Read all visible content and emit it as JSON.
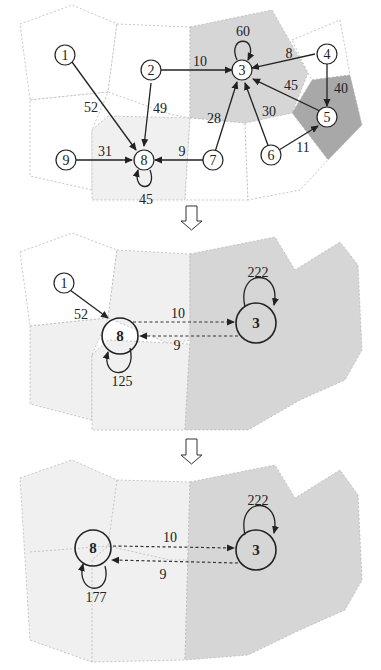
{
  "panels": [
    {
      "id": "initial-graph",
      "nodes": [
        {
          "id": "1",
          "label": "1"
        },
        {
          "id": "2",
          "label": "2"
        },
        {
          "id": "3",
          "label": "3"
        },
        {
          "id": "4",
          "label": "4"
        },
        {
          "id": "5",
          "label": "5"
        },
        {
          "id": "6",
          "label": "6"
        },
        {
          "id": "7",
          "label": "7"
        },
        {
          "id": "8",
          "label": "8"
        },
        {
          "id": "9",
          "label": "9"
        }
      ],
      "edges": [
        {
          "from": "1",
          "to": "8",
          "weight": "52"
        },
        {
          "from": "2",
          "to": "8",
          "weight": "49"
        },
        {
          "from": "2",
          "to": "3",
          "weight": "10"
        },
        {
          "from": "3",
          "to": "3",
          "weight": "60"
        },
        {
          "from": "4",
          "to": "3",
          "weight": "8"
        },
        {
          "from": "4",
          "to": "5",
          "weight": "40"
        },
        {
          "from": "5",
          "to": "3",
          "weight": "45"
        },
        {
          "from": "6",
          "to": "3",
          "weight": "30"
        },
        {
          "from": "6",
          "to": "5",
          "weight": "11"
        },
        {
          "from": "7",
          "to": "3",
          "weight": "28"
        },
        {
          "from": "7",
          "to": "8",
          "weight": "9"
        },
        {
          "from": "9",
          "to": "8",
          "weight": "31"
        },
        {
          "from": "8",
          "to": "8",
          "weight": "45"
        }
      ]
    },
    {
      "id": "intermediate-graph",
      "nodes": [
        {
          "id": "1",
          "label": "1"
        },
        {
          "id": "8",
          "label": "8"
        },
        {
          "id": "3",
          "label": "3"
        }
      ],
      "edges": [
        {
          "from": "1",
          "to": "8",
          "weight": "52"
        },
        {
          "from": "8",
          "to": "3",
          "weight": "10"
        },
        {
          "from": "3",
          "to": "8",
          "weight": "9"
        },
        {
          "from": "3",
          "to": "3",
          "weight": "222"
        },
        {
          "from": "8",
          "to": "8",
          "weight": "125"
        }
      ]
    },
    {
      "id": "final-graph",
      "nodes": [
        {
          "id": "8",
          "label": "8"
        },
        {
          "id": "3",
          "label": "3"
        }
      ],
      "edges": [
        {
          "from": "8",
          "to": "3",
          "weight": "10"
        },
        {
          "from": "3",
          "to": "8",
          "weight": "9"
        },
        {
          "from": "3",
          "to": "3",
          "weight": "222"
        },
        {
          "from": "8",
          "to": "8",
          "weight": "177"
        }
      ]
    }
  ],
  "colors": {
    "region_white": "#ffffff",
    "region_light": "#f0f0f0",
    "region_mid": "#d6d6d6",
    "region_dark": "#a8a8a8",
    "stroke": "#222222"
  },
  "transitions": [
    "down-arrow",
    "down-arrow"
  ]
}
